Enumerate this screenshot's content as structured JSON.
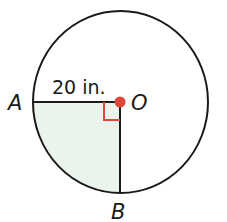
{
  "diagram": {
    "radius_label": "20 in.",
    "points": {
      "A": "A",
      "O": "O",
      "B": "B"
    },
    "colors": {
      "outline": "#1a1a1a",
      "center_dot": "#e0473b",
      "right_angle_mark": "#e0473b",
      "shaded_sector": "#eaf3ec"
    }
  }
}
